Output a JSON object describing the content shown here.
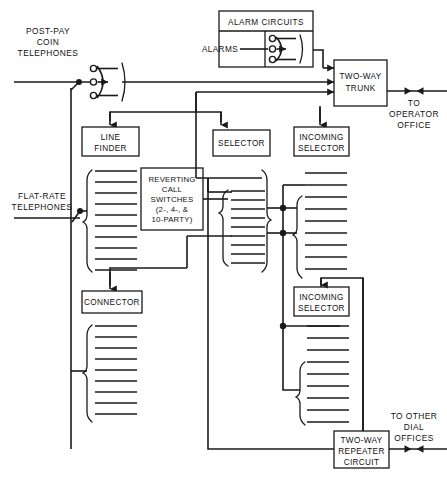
{
  "diagram": {
    "background_color": "#ffffff",
    "line_color": "#1a1a1a",
    "width": 447,
    "height": 477
  },
  "labels": {
    "post_pay_coin": [
      "POST-PAY",
      "COIN",
      "TELEPHONES"
    ],
    "flat_rate": [
      "FLAT-RATE",
      "TELEPHONES"
    ],
    "to_operator": [
      "TO",
      "OPERATOR",
      "OFFICE"
    ],
    "to_other_dial": [
      "TO OTHER",
      "DIAL",
      "OFFICES"
    ]
  },
  "boxes": {
    "alarm_circuits": {
      "header": "ALARM CIRCUITS",
      "inner_label": "ALARMS"
    },
    "two_way_trunk": [
      "TWO-WAY",
      "TRUNK"
    ],
    "line_finder": [
      "LINE",
      "FINDER"
    ],
    "selector": [
      "SELECTOR"
    ],
    "incoming_selector_top": [
      "INCOMING",
      "SELECTOR"
    ],
    "reverting_call_switches": [
      "REVERTING",
      "CALL",
      "SWITCHES",
      "(2-, 4-, &",
      "10-PARTY)"
    ],
    "connector": [
      "CONNECTOR"
    ],
    "incoming_selector_lower": [
      "INCOMING",
      "SELECTOR"
    ],
    "two_way_repeater": [
      "TWO-WAY",
      "REPEATER",
      "CIRCUIT"
    ]
  },
  "banks": {
    "line_finder_bank": {
      "name": "line-finder-bank",
      "lines": 10
    },
    "selector_bank": {
      "name": "selector-bank",
      "lines": 10
    },
    "incoming_selector_top_bank": {
      "name": "incoming-selector-top-bank",
      "lines": 10
    },
    "connector_bank": {
      "name": "connector-bank",
      "lines": 10
    },
    "incoming_selector_lower_bank": {
      "name": "incoming-selector-lower-bank",
      "lines": 10
    }
  },
  "switch_symbols": {
    "coin_selector_contacts": 3,
    "alarm_selector_contacts": 3
  }
}
